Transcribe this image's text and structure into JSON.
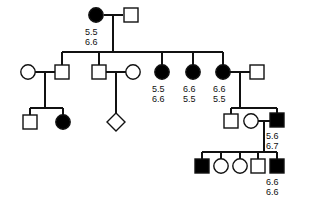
{
  "figure": {
    "type": "pedigree-chart",
    "symbol_legend": {
      "filled_circle": "affected female",
      "open_circle": "unaffected female",
      "filled_square": "affected male",
      "open_square": "unaffected male",
      "diamond": "unknown sex"
    },
    "line_color": "#111111",
    "fill_affected": "#000000",
    "fill_unaffected": "#ffffff"
  },
  "individuals": [
    {
      "id": "I-1",
      "shape": "circle",
      "affected": true,
      "cx": 96,
      "cy": 15,
      "genotype": [
        "5.5",
        "6.6"
      ],
      "label_x": 85,
      "label_y": 27
    },
    {
      "id": "I-2",
      "shape": "square",
      "affected": false,
      "cx": 131,
      "cy": 15,
      "genotype": [],
      "label_x": 0,
      "label_y": 0
    },
    {
      "id": "II-1",
      "shape": "circle",
      "affected": false,
      "cx": 28,
      "cy": 72,
      "genotype": [],
      "label_x": 0,
      "label_y": 0
    },
    {
      "id": "II-2",
      "shape": "square",
      "affected": false,
      "cx": 62,
      "cy": 72,
      "genotype": [],
      "label_x": 0,
      "label_y": 0
    },
    {
      "id": "II-3",
      "shape": "square",
      "affected": false,
      "cx": 99,
      "cy": 72,
      "genotype": [],
      "label_x": 0,
      "label_y": 0
    },
    {
      "id": "II-4",
      "shape": "circle",
      "affected": false,
      "cx": 133,
      "cy": 72,
      "genotype": [],
      "label_x": 0,
      "label_y": 0
    },
    {
      "id": "II-5",
      "shape": "circle",
      "affected": true,
      "cx": 162,
      "cy": 72,
      "genotype": [
        "5.5",
        "6.6"
      ],
      "label_x": 152,
      "label_y": 84
    },
    {
      "id": "II-6",
      "shape": "circle",
      "affected": true,
      "cx": 193,
      "cy": 72,
      "genotype": [
        "6.6",
        "5.5"
      ],
      "label_x": 183,
      "label_y": 84
    },
    {
      "id": "II-7",
      "shape": "circle",
      "affected": true,
      "cx": 223,
      "cy": 72,
      "genotype": [
        "6.6",
        "5.5"
      ],
      "label_x": 213,
      "label_y": 84
    },
    {
      "id": "II-8",
      "shape": "square",
      "affected": false,
      "cx": 257,
      "cy": 72,
      "genotype": [],
      "label_x": 0,
      "label_y": 0
    },
    {
      "id": "III-1",
      "shape": "square",
      "affected": false,
      "cx": 30,
      "cy": 122,
      "genotype": [],
      "label_x": 0,
      "label_y": 0
    },
    {
      "id": "III-2",
      "shape": "circle",
      "affected": true,
      "cx": 63,
      "cy": 122,
      "genotype": [],
      "label_x": 0,
      "label_y": 0
    },
    {
      "id": "III-3",
      "shape": "diamond",
      "affected": false,
      "cx": 116,
      "cy": 122,
      "genotype": [],
      "label_x": 0,
      "label_y": 0
    },
    {
      "id": "III-4",
      "shape": "square",
      "affected": false,
      "cx": 231,
      "cy": 121,
      "genotype": [],
      "label_x": 0,
      "label_y": 0
    },
    {
      "id": "III-5",
      "shape": "circle",
      "affected": false,
      "cx": 251,
      "cy": 121,
      "genotype": [],
      "label_x": 0,
      "label_y": 0
    },
    {
      "id": "III-6",
      "shape": "square",
      "affected": true,
      "cx": 277,
      "cy": 120,
      "genotype": [
        "5.6",
        "6.7"
      ],
      "label_x": 266,
      "label_y": 131
    },
    {
      "id": "IV-1",
      "shape": "square",
      "affected": true,
      "cx": 202,
      "cy": 166,
      "genotype": [],
      "label_x": 0,
      "label_y": 0
    },
    {
      "id": "IV-2",
      "shape": "circle",
      "affected": false,
      "cx": 221,
      "cy": 166,
      "genotype": [],
      "label_x": 0,
      "label_y": 0
    },
    {
      "id": "IV-3",
      "shape": "circle",
      "affected": false,
      "cx": 240,
      "cy": 166,
      "genotype": [],
      "label_x": 0,
      "label_y": 0
    },
    {
      "id": "IV-4",
      "shape": "square",
      "affected": false,
      "cx": 258,
      "cy": 166,
      "genotype": [],
      "label_x": 0,
      "label_y": 0
    },
    {
      "id": "IV-5",
      "shape": "square",
      "affected": true,
      "cx": 277,
      "cy": 166,
      "genotype": [
        "6.6",
        "6.6"
      ],
      "label_x": 266,
      "label_y": 177
    }
  ],
  "connectors": {
    "mating_lines": [
      {
        "name": "mating-I-1-I-2",
        "x1": 104,
        "y1": 15,
        "x2": 123,
        "y2": 15
      },
      {
        "name": "mating-II-1-II-2",
        "x1": 35,
        "y1": 72,
        "x2": 55,
        "y2": 72
      },
      {
        "name": "mating-II-3-II-4",
        "x1": 106,
        "y1": 72,
        "x2": 126,
        "y2": 72
      },
      {
        "name": "mating-II-7-II-8",
        "x1": 230,
        "y1": 72,
        "x2": 250,
        "y2": 72
      },
      {
        "name": "mating-III-5-III-6",
        "x1": 258,
        "y1": 121,
        "x2": 270,
        "y2": 121
      }
    ],
    "descent_lines": [
      {
        "name": "descent-I-to-II",
        "x1": 113,
        "y1": 15,
        "x2": 113,
        "y2": 52
      },
      {
        "name": "descent-II-1-to-III",
        "x1": 45,
        "y1": 72,
        "x2": 45,
        "y2": 108
      },
      {
        "name": "descent-II-3-to-III",
        "x1": 116,
        "y1": 72,
        "x2": 116,
        "y2": 114
      },
      {
        "name": "descent-II-7-to-III",
        "x1": 240,
        "y1": 72,
        "x2": 240,
        "y2": 108
      },
      {
        "name": "descent-III-to-IV",
        "x1": 264,
        "y1": 121,
        "x2": 264,
        "y2": 152
      }
    ],
    "sibship_lines": [
      {
        "name": "sibship-II",
        "x1": 62,
        "y1": 52,
        "x2": 223,
        "y2": 52
      },
      {
        "name": "sibship-III-left",
        "x1": 30,
        "y1": 108,
        "x2": 63,
        "y2": 108
      },
      {
        "name": "sibship-III-right",
        "x1": 231,
        "y1": 108,
        "x2": 277,
        "y2": 108
      },
      {
        "name": "sibship-IV",
        "x1": 202,
        "y1": 152,
        "x2": 277,
        "y2": 152
      }
    ],
    "stems": [
      {
        "name": "stem-II-2",
        "x1": 62,
        "y1": 52,
        "x2": 62,
        "y2": 65
      },
      {
        "name": "stem-II-3",
        "x1": 99,
        "y1": 52,
        "x2": 99,
        "y2": 65
      },
      {
        "name": "stem-II-5",
        "x1": 162,
        "y1": 52,
        "x2": 162,
        "y2": 65
      },
      {
        "name": "stem-II-6",
        "x1": 193,
        "y1": 52,
        "x2": 193,
        "y2": 65
      },
      {
        "name": "stem-II-7",
        "x1": 223,
        "y1": 52,
        "x2": 223,
        "y2": 65
      },
      {
        "name": "stem-III-1",
        "x1": 30,
        "y1": 108,
        "x2": 30,
        "y2": 115
      },
      {
        "name": "stem-III-2",
        "x1": 63,
        "y1": 108,
        "x2": 63,
        "y2": 115
      },
      {
        "name": "stem-III-4",
        "x1": 231,
        "y1": 108,
        "x2": 231,
        "y2": 114
      },
      {
        "name": "stem-III-6",
        "x1": 277,
        "y1": 108,
        "x2": 277,
        "y2": 113
      },
      {
        "name": "stem-IV-1",
        "x1": 202,
        "y1": 152,
        "x2": 202,
        "y2": 159
      },
      {
        "name": "stem-IV-2",
        "x1": 221,
        "y1": 152,
        "x2": 221,
        "y2": 159
      },
      {
        "name": "stem-IV-3",
        "x1": 240,
        "y1": 152,
        "x2": 240,
        "y2": 159
      },
      {
        "name": "stem-IV-4",
        "x1": 258,
        "y1": 152,
        "x2": 258,
        "y2": 159
      },
      {
        "name": "stem-IV-5",
        "x1": 277,
        "y1": 152,
        "x2": 277,
        "y2": 159
      }
    ]
  },
  "chart_data": {
    "type": "pedigree",
    "title": "",
    "generations": 4,
    "genotype_labels": [
      {
        "individual": "I-1",
        "alleles": [
          "5.5",
          "6.6"
        ]
      },
      {
        "individual": "II-5",
        "alleles": [
          "5.5",
          "6.6"
        ]
      },
      {
        "individual": "II-6",
        "alleles": [
          "6.6",
          "5.5"
        ]
      },
      {
        "individual": "II-7",
        "alleles": [
          "6.6",
          "5.5"
        ]
      },
      {
        "individual": "III-6",
        "alleles": [
          "5.6",
          "6.7"
        ]
      },
      {
        "individual": "IV-5",
        "alleles": [
          "6.6",
          "6.6"
        ]
      }
    ]
  }
}
